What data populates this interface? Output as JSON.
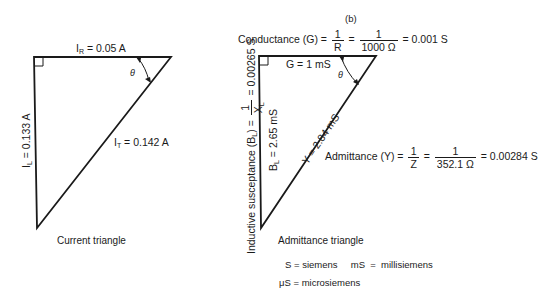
{
  "current_triangle": {
    "caption": "Current triangle",
    "ir_label": "I",
    "ir_sub": "R",
    "ir_value": " = 0.05 A",
    "il_label": "I",
    "il_sub": "L",
    "il_value": " = 0.133 A",
    "it_label": "I",
    "it_sub": "T",
    "it_value": " = 0.142 A",
    "angle": "θ"
  },
  "admittance_triangle": {
    "panel_label": "(b)",
    "caption": "Admittance triangle",
    "conductance": {
      "prefix": "Conductance (G) =",
      "frac1_num": "1",
      "frac1_den": "R",
      "eq": "=",
      "frac2_num": "1",
      "frac2_den": "1000 Ω",
      "result": "= 0.001 S"
    },
    "g_label": "G = 1 mS",
    "bl_label": "B",
    "bl_sub": "L",
    "bl_value": " = 2.65 mS",
    "y_label": "Y = 2.84 mS",
    "angle": "θ",
    "susceptance": {
      "prefix": "Inductive susceptance (B",
      "sub": "L",
      "mid": ") =",
      "frac_num": "1",
      "frac_den": "X",
      "frac_den_sub": "L",
      "result": "= 0.00265 S"
    },
    "admittance": {
      "prefix": "Admittance (Y) =",
      "frac1_num": "1",
      "frac1_den": "Z",
      "eq": "=",
      "frac2_num": "1",
      "frac2_den": "352.1 Ω",
      "result": "= 0.00284  S"
    }
  },
  "legend": {
    "line1": "S = siemens     mS  =  millisiemens",
    "line2": "μS = microsiemens"
  }
}
